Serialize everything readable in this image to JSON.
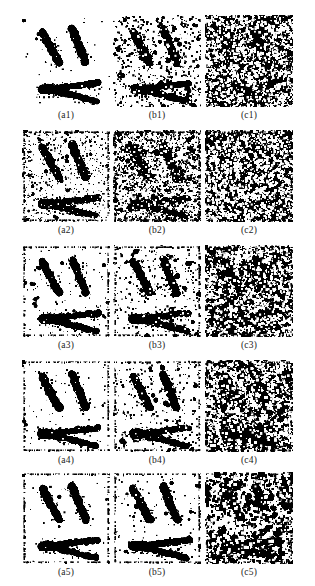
{
  "figure": {
    "type": "image-grid",
    "background_color": "#ffffff",
    "foreground_color": "#000000",
    "rows": 5,
    "columns": 3,
    "panel_width": 88,
    "panel_height": 92,
    "column_labels": [
      "a",
      "b",
      "c"
    ],
    "row_labels": [
      "1",
      "2",
      "3",
      "4",
      "5"
    ],
    "panels": [
      {
        "caption": "(a1)",
        "row": 1,
        "col": "a",
        "noise_density": 0.004,
        "border_noise": 0.0,
        "speck_scale": 1.0,
        "blob_count": 7,
        "seed": 101
      },
      {
        "caption": "(b1)",
        "row": 1,
        "col": "b",
        "noise_density": 0.055,
        "border_noise": 0.02,
        "speck_scale": 1.3,
        "blob_count": 46,
        "seed": 102
      },
      {
        "caption": "(c1)",
        "row": 1,
        "col": "c",
        "noise_density": 0.235,
        "border_noise": 0.1,
        "speck_scale": 1.5,
        "blob_count": 200,
        "seed": 103
      },
      {
        "caption": "(a2)",
        "row": 2,
        "col": "a",
        "noise_density": 0.06,
        "border_noise": 0.55,
        "speck_scale": 0.9,
        "blob_count": 60,
        "seed": 201
      },
      {
        "caption": "(b2)",
        "row": 2,
        "col": "b",
        "noise_density": 0.16,
        "border_noise": 0.5,
        "speck_scale": 1.2,
        "blob_count": 150,
        "seed": 202
      },
      {
        "caption": "(c2)",
        "row": 2,
        "col": "c",
        "noise_density": 0.33,
        "border_noise": 0.3,
        "speck_scale": 1.5,
        "blob_count": 280,
        "seed": 203
      },
      {
        "caption": "(a3)",
        "row": 3,
        "col": "a",
        "noise_density": 0.01,
        "border_noise": 0.45,
        "speck_scale": 0.9,
        "blob_count": 14,
        "seed": 301
      },
      {
        "caption": "(b3)",
        "row": 3,
        "col": "b",
        "noise_density": 0.035,
        "border_noise": 0.4,
        "speck_scale": 1.2,
        "blob_count": 40,
        "seed": 302
      },
      {
        "caption": "(c3)",
        "row": 3,
        "col": "c",
        "noise_density": 0.2,
        "border_noise": 0.25,
        "speck_scale": 1.5,
        "blob_count": 190,
        "seed": 303
      },
      {
        "caption": "(a4)",
        "row": 4,
        "col": "a",
        "noise_density": 0.006,
        "border_noise": 0.45,
        "speck_scale": 0.9,
        "blob_count": 10,
        "seed": 401
      },
      {
        "caption": "(b4)",
        "row": 4,
        "col": "b",
        "noise_density": 0.03,
        "border_noise": 0.4,
        "speck_scale": 1.2,
        "blob_count": 34,
        "seed": 402
      },
      {
        "caption": "(c4)",
        "row": 4,
        "col": "c",
        "noise_density": 0.175,
        "border_noise": 0.25,
        "speck_scale": 1.6,
        "blob_count": 175,
        "seed": 403
      },
      {
        "caption": "(a5)",
        "row": 5,
        "col": "a",
        "noise_density": 0.003,
        "border_noise": 0.5,
        "speck_scale": 0.9,
        "blob_count": 5,
        "seed": 501
      },
      {
        "caption": "(b5)",
        "row": 5,
        "col": "b",
        "noise_density": 0.012,
        "border_noise": 0.45,
        "speck_scale": 1.1,
        "blob_count": 16,
        "seed": 502
      },
      {
        "caption": "(c5)",
        "row": 5,
        "col": "c",
        "noise_density": 0.095,
        "border_noise": 0.28,
        "speck_scale": 1.8,
        "blob_count": 110,
        "seed": 503
      }
    ],
    "shape": {
      "description": "two diagonal bars above a forked arrow",
      "strokes": [
        {
          "name": "left-bar",
          "x1": 20,
          "y1": 16,
          "x2": 37,
          "y2": 48,
          "width": 7
        },
        {
          "name": "right-bar",
          "x1": 50,
          "y1": 14,
          "x2": 64,
          "y2": 48,
          "width": 7
        },
        {
          "name": "fork-upper",
          "x1": 26,
          "y1": 74,
          "x2": 76,
          "y2": 68,
          "width": 6
        },
        {
          "name": "fork-lower",
          "x1": 26,
          "y1": 74,
          "x2": 74,
          "y2": 86,
          "width": 6
        },
        {
          "name": "fork-knot",
          "x1": 20,
          "y1": 74,
          "x2": 30,
          "y2": 74,
          "width": 8
        }
      ]
    },
    "layout": {
      "row_tops": [
        15,
        130,
        245,
        360,
        472
      ],
      "caption_tops": [
        110,
        225,
        340,
        455,
        567
      ],
      "column_lefts": [
        22,
        113,
        205
      ]
    }
  }
}
